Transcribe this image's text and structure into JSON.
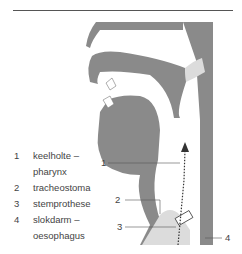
{
  "legend": [
    {
      "num": "1",
      "lines": [
        "keelholte –",
        "pharynx"
      ]
    },
    {
      "num": "2",
      "lines": [
        "tracheostoma"
      ]
    },
    {
      "num": "3",
      "lines": [
        "stemprothese"
      ]
    },
    {
      "num": "4",
      "lines": [
        "slokdarm –",
        "oesophagus"
      ]
    }
  ],
  "callouts": [
    {
      "num": "1"
    },
    {
      "num": "2"
    },
    {
      "num": "3"
    },
    {
      "num": "4"
    }
  ],
  "colors": {
    "tissue": "#8a8a8a",
    "line": "#555555",
    "text": "#444444"
  }
}
